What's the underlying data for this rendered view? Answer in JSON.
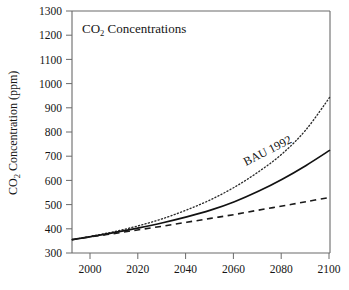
{
  "chart_data": {
    "type": "line",
    "title": "CO2 Concentrations",
    "title_parts": {
      "lead": "CO",
      "sub": "2",
      "tail": " Concentrations"
    },
    "xlabel": "",
    "ylabel": "CO2 Concentration (ppm)",
    "ylabel_parts": {
      "lead": "CO",
      "sub": "2",
      "tail": " Concentration (ppm)"
    },
    "xlim": [
      1992,
      2100
    ],
    "ylim": [
      300,
      1300
    ],
    "xticks": [
      2000,
      2020,
      2040,
      2060,
      2080,
      2100
    ],
    "xtick_labels": [
      "2000",
      "2020",
      "2040",
      "2060",
      "2080",
      "2100"
    ],
    "yticks": [
      300,
      400,
      500,
      600,
      700,
      800,
      900,
      1000,
      1100,
      1200,
      1300
    ],
    "ytick_labels": [
      "300",
      "400",
      "500",
      "600",
      "700",
      "800",
      "900",
      "1000",
      "1100",
      "1200",
      "1300"
    ],
    "x_minor_ticks": [
      2010,
      2030,
      2050,
      2070,
      2090
    ],
    "grid": false,
    "legend": "none",
    "annotations": [
      {
        "text": "BAU 1992",
        "series": "high-scenario",
        "x": 2083,
        "y": 640,
        "rotation": -27
      }
    ],
    "x": [
      1992,
      2000,
      2010,
      2020,
      2030,
      2040,
      2050,
      2060,
      2070,
      2080,
      2090,
      2100
    ],
    "series": [
      {
        "name": "upper-scenario",
        "style": "dotted",
        "values": [
          355,
          369,
          389,
          413,
          442,
          478,
          520,
          572,
          635,
          710,
          810,
          945
        ]
      },
      {
        "name": "high-scenario",
        "style": "solid",
        "label": "BAU 1992",
        "values": [
          355,
          368,
          385,
          404,
          425,
          449,
          477,
          512,
          555,
          605,
          662,
          725
        ]
      },
      {
        "name": "lower-scenario",
        "style": "dashed",
        "values": [
          355,
          367,
          381,
          396,
          411,
          427,
          443,
          459,
          477,
          494,
          512,
          530
        ]
      }
    ]
  },
  "axes": {
    "tick_color": "#6a6a6a",
    "line_color": "#121212"
  }
}
